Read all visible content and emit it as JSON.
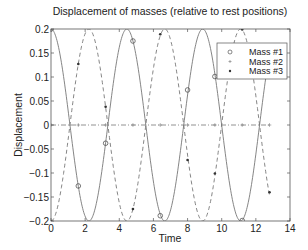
{
  "chart_data": {
    "type": "line",
    "title": "Displacement of masses (relative to rest positions)",
    "xlabel": "Time",
    "ylabel": "Displacement",
    "xlim": [
      0,
      14
    ],
    "ylim": [
      -0.2,
      0.2
    ],
    "xticks": [
      0,
      2,
      4,
      6,
      8,
      10,
      12,
      14
    ],
    "xtick_labels": [
      "0",
      "2",
      "4",
      "6",
      "8",
      "10",
      "12",
      "14"
    ],
    "yticks": [
      -0.2,
      -0.15,
      -0.1,
      -0.05,
      0,
      0.05,
      0.1,
      0.15,
      0.2
    ],
    "ytick_labels": [
      "−0.2",
      "−0.15",
      "−0.1",
      "−0.05",
      "0",
      "0.05",
      "0.1",
      "0.15",
      "0.2"
    ],
    "grid": false,
    "legend_position": "upper right",
    "t_end": 12.8,
    "omega": 1.41421356,
    "marker_times": [
      0,
      1.6,
      3.2,
      4.8,
      6.4,
      8.0,
      9.6,
      11.2,
      12.8
    ],
    "series": [
      {
        "name": "Mass #1",
        "line_style": "solid",
        "marker": "circle",
        "amplitude": 0.2,
        "formula": "0.2*cos(sqrt(2)*t)",
        "marker_values": [
          0.2,
          -0.127,
          -0.038,
          0.175,
          -0.189,
          0.073,
          0.101,
          -0.199,
          0.14
        ]
      },
      {
        "name": "Mass #2",
        "line_style": "dashdot",
        "marker": "plus",
        "amplitude": 0.0,
        "formula": "0",
        "marker_values": [
          0,
          0,
          0,
          0,
          0,
          0,
          0,
          0,
          0
        ]
      },
      {
        "name": "Mass #3",
        "line_style": "dashed",
        "marker": "dot",
        "amplitude": -0.2,
        "formula": "-0.2*cos(sqrt(2)*t)",
        "marker_values": [
          -0.2,
          0.127,
          0.038,
          -0.175,
          0.189,
          -0.073,
          -0.101,
          0.199,
          -0.14
        ]
      }
    ],
    "legend": [
      "Mass #1",
      "Mass #2",
      "Mass #3"
    ]
  },
  "colors": {
    "axes": "#555555",
    "line": "#777777",
    "text": "#222222"
  }
}
